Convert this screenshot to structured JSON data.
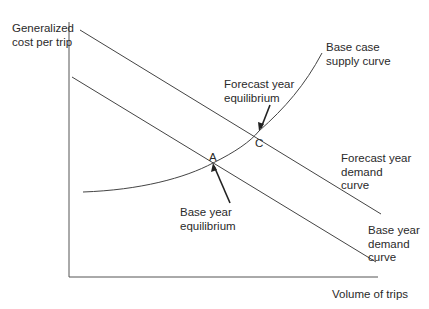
{
  "axes": {
    "y_label": "Generalized\ncost per trip",
    "x_label": "Volume of trips"
  },
  "curves": {
    "supply": "Base case\nsupply curve",
    "forecast_demand": "Forecast year\ndemand\ncurve",
    "base_demand": "Base year\ndemand\ncurve"
  },
  "points": {
    "A": "A",
    "C": "C"
  },
  "annotations": {
    "forecast_equilibrium": "Forecast year\nequilibrium",
    "base_equilibrium": "Base year\nequilibrium"
  },
  "colors": {
    "line": "#444444",
    "text": "#2a2a2a"
  }
}
